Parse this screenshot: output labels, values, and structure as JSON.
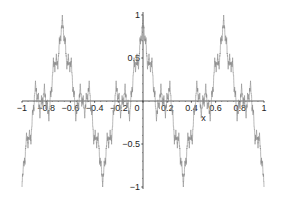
{
  "chart_data": {
    "type": "line",
    "title": "",
    "xlabel": "x",
    "ylabel": "",
    "xlim": [
      -1,
      1
    ],
    "ylim": [
      -1,
      1
    ],
    "grid": false,
    "legend": "none",
    "x_ticks": [
      -1,
      -0.8,
      -0.6,
      -0.4,
      -0.2,
      0,
      0.2,
      0.4,
      0.6,
      0.8,
      1
    ],
    "x_tick_labels": [
      "-1",
      "-0.8",
      "-0.6",
      "-0.4",
      "-0.2",
      "0",
      "0.2",
      "0.4",
      "0.6",
      "0.8",
      "1"
    ],
    "y_ticks": [
      1,
      0.5,
      -0.5,
      -1
    ],
    "y_tick_labels": [
      "1",
      "0.5",
      "-0.5",
      "-1"
    ],
    "series": [
      {
        "name": "fractal-curve",
        "function": "Weierstrass-type sum of a^n cos(b^n * 3*pi*x), a=0.5, b=3, normalized to [-1,1]",
        "a": 0.5,
        "b": 3,
        "terms": 7,
        "key_points": [
          {
            "x": -1,
            "y": -1
          },
          {
            "x": -0.667,
            "y": 1
          },
          {
            "x": -0.333,
            "y": -1
          },
          {
            "x": 0,
            "y": 1
          },
          {
            "x": 0.333,
            "y": -1
          },
          {
            "x": 0.667,
            "y": 1
          },
          {
            "x": 1,
            "y": -1
          }
        ],
        "color": "#8a8a8a"
      }
    ],
    "axis_color": "#333333"
  }
}
